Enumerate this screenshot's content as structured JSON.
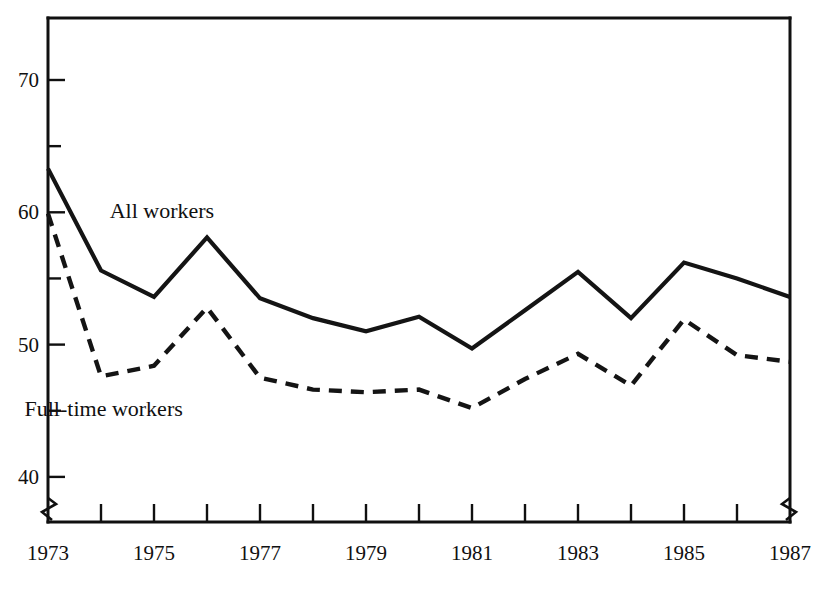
{
  "chart_data": {
    "type": "line",
    "title": "",
    "subtitle": "",
    "xlabel": "",
    "ylabel": "",
    "x": [
      1973,
      1974,
      1975,
      1976,
      1977,
      1978,
      1979,
      1980,
      1981,
      1982,
      1983,
      1984,
      1985,
      1986,
      1987
    ],
    "xlim": [
      1973,
      1987
    ],
    "ylim": [
      38.5,
      75.5
    ],
    "y_ticks_major": [
      40,
      50,
      60,
      70
    ],
    "y_ticks_minor": [
      45,
      55,
      65
    ],
    "y_tick_labels": [
      "40",
      "50",
      "60",
      "70"
    ],
    "x_tick_labels": [
      "1973",
      "1975",
      "1977",
      "1979",
      "1981",
      "1983",
      "1985",
      "1987"
    ],
    "x_tick_label_years": [
      1973,
      1975,
      1977,
      1979,
      1981,
      1983,
      1985,
      1987
    ],
    "grid": false,
    "legend_position": "inline-annotations",
    "axis_break_x": true,
    "axis_break_y": true,
    "series": [
      {
        "name": "All workers",
        "style": "solid",
        "color": "#141414",
        "values": [
          63.3,
          55.6,
          53.6,
          58.1,
          53.5,
          52.0,
          51.0,
          52.1,
          49.7,
          52.6,
          55.5,
          52.0,
          56.2,
          55.0,
          53.6
        ]
      },
      {
        "name": "Full-time workers",
        "style": "dashed",
        "color": "#141414",
        "values": [
          59.9,
          47.6,
          48.4,
          52.8,
          47.5,
          46.6,
          46.4,
          46.6,
          45.2,
          47.4,
          49.3,
          46.9,
          51.9,
          49.2,
          48.7
        ]
      }
    ],
    "annotations": [
      {
        "text": "All workers",
        "x": 1975.15,
        "y": 59.6
      },
      {
        "text": "Full-time workers",
        "x": 1974.05,
        "y": 44.6
      }
    ]
  }
}
